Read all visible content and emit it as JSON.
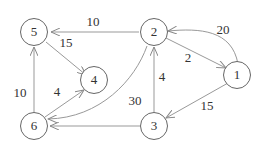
{
  "graph": {
    "nodes": [
      {
        "id": "1",
        "label": "1",
        "x": 237,
        "y": 130
      },
      {
        "id": "2",
        "label": "2",
        "x": 153,
        "y": 32
      },
      {
        "id": "3",
        "label": "3",
        "x": 153,
        "y": 127
      },
      {
        "id": "4",
        "label": "4",
        "x": 97,
        "y": 82
      },
      {
        "id": "5",
        "label": "5",
        "x": 36,
        "y": 32
      },
      {
        "id": "6",
        "label": "6",
        "x": 36,
        "y": 127
      }
    ],
    "edges": [
      {
        "from": "2",
        "to": "5",
        "weight": "10"
      },
      {
        "from": "5",
        "to": "4",
        "weight": "15"
      },
      {
        "from": "2",
        "to": "1",
        "weight": "2"
      },
      {
        "from": "1",
        "to": "2",
        "weight": "20"
      },
      {
        "from": "6",
        "to": "5",
        "weight": "10"
      },
      {
        "from": "6",
        "to": "4",
        "weight": "4"
      },
      {
        "from": "2",
        "to": "6",
        "weight": "30"
      },
      {
        "from": "3",
        "to": "2",
        "weight": "4"
      },
      {
        "from": "3",
        "to": "6",
        "weight": ""
      },
      {
        "from": "1",
        "to": "3",
        "weight": "15"
      }
    ],
    "edge_labels": {
      "e25": "10",
      "e54": "15",
      "e21": "2",
      "e12": "20",
      "e65": "10",
      "e64": "4",
      "e26": "30",
      "e32": "4",
      "e13": "15"
    },
    "stroke_color": "#999999"
  }
}
